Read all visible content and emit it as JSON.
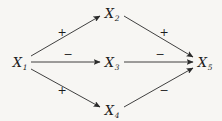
{
  "figure": {
    "type": "signed-path-diagram",
    "background_color": "#f7f6f3",
    "line_color": "#2b2b2b",
    "text_color": "#1c1c1c",
    "width": 222,
    "height": 121
  },
  "nodes": [
    {
      "id": "X1",
      "base": "X",
      "subscript": "1",
      "x": 20,
      "y": 62
    },
    {
      "id": "X2",
      "base": "X",
      "subscript": "2",
      "x": 112,
      "y": 13
    },
    {
      "id": "X3",
      "base": "X",
      "subscript": "3",
      "x": 112,
      "y": 62
    },
    {
      "id": "X4",
      "base": "X",
      "subscript": "4",
      "x": 112,
      "y": 110
    },
    {
      "id": "X5",
      "base": "X",
      "subscript": "5",
      "x": 205,
      "y": 62
    }
  ],
  "edges": [
    {
      "id": "e1",
      "from": "X1",
      "to": "X2",
      "sign": "+",
      "sign_x": 62,
      "sign_y": 32
    },
    {
      "id": "e2",
      "from": "X1",
      "to": "X3",
      "sign": "−",
      "sign_x": 68,
      "sign_y": 54
    },
    {
      "id": "e3",
      "from": "X1",
      "to": "X4",
      "sign": "+",
      "sign_x": 62,
      "sign_y": 90
    },
    {
      "id": "e4",
      "from": "X2",
      "to": "X5",
      "sign": "+",
      "sign_x": 164,
      "sign_y": 32
    },
    {
      "id": "e5",
      "from": "X3",
      "to": "X5",
      "sign": "−",
      "sign_x": 160,
      "sign_y": 54
    },
    {
      "id": "e6",
      "from": "X4",
      "to": "X5",
      "sign": "−",
      "sign_x": 164,
      "sign_y": 90
    }
  ],
  "geometry": {
    "paths": [
      {
        "id": "e1",
        "x1": 31,
        "y1": 56,
        "x2": 100,
        "y2": 16
      },
      {
        "id": "e2",
        "x1": 31,
        "y1": 62,
        "x2": 100,
        "y2": 62
      },
      {
        "id": "e3",
        "x1": 31,
        "y1": 69,
        "x2": 100,
        "y2": 107
      },
      {
        "id": "e4",
        "x1": 124,
        "y1": 16,
        "x2": 193,
        "y2": 57
      },
      {
        "id": "e5",
        "x1": 124,
        "y1": 62,
        "x2": 193,
        "y2": 62
      },
      {
        "id": "e6",
        "x1": 124,
        "y1": 107,
        "x2": 193,
        "y2": 68
      }
    ]
  }
}
